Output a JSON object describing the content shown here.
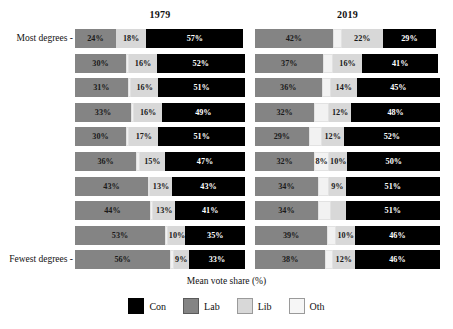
{
  "chart_data": {
    "type": "bar",
    "subtype": "stacked-horizontal-percent",
    "title": "",
    "xlabel": "Mean vote share (%)",
    "ylabel": "",
    "xlim": [
      0,
      100
    ],
    "grid": false,
    "legend_position": "bottom",
    "panels": [
      {
        "key": "p1979",
        "label": "1979"
      },
      {
        "key": "p2019",
        "label": "2019"
      }
    ],
    "y_tick_labels": {
      "top": "Most degrees -",
      "bottom": "Fewest degrees -"
    },
    "categories": [
      "Con",
      "Lab",
      "Lib",
      "Oth"
    ],
    "colors": {
      "Con": "#000000",
      "Lab": "#848484",
      "Lib": "#d8d8d8",
      "Oth": "#f2f2f2"
    },
    "series_order": [
      "Lab",
      "Oth",
      "Lib",
      "Con"
    ],
    "rows": [
      {
        "index": 0,
        "p1979": {
          "Lab": 24,
          "Oth": 0,
          "Lib": 18,
          "Con": 57,
          "labels": {
            "Lab": "24%",
            "Oth": "",
            "Lib": "18%",
            "Con": "57%"
          }
        },
        "p2019": {
          "Lab": 42,
          "Oth": 5,
          "Lib": 22,
          "Con": 29,
          "labels": {
            "Lab": "42%",
            "Oth": "",
            "Lib": "22%",
            "Con": "29%"
          }
        }
      },
      {
        "index": 1,
        "p1979": {
          "Lab": 30,
          "Oth": 2,
          "Lib": 16,
          "Con": 52,
          "labels": {
            "Lab": "30%",
            "Oth": "",
            "Lib": "16%",
            "Con": "52%"
          }
        },
        "p2019": {
          "Lab": 37,
          "Oth": 5,
          "Lib": 16,
          "Con": 41,
          "labels": {
            "Lab": "37%",
            "Oth": "",
            "Lib": "16%",
            "Con": "41%"
          }
        }
      },
      {
        "index": 2,
        "p1979": {
          "Lab": 31,
          "Oth": 2,
          "Lib": 16,
          "Con": 51,
          "labels": {
            "Lab": "31%",
            "Oth": "",
            "Lib": "16%",
            "Con": "51%"
          }
        },
        "p2019": {
          "Lab": 36,
          "Oth": 5,
          "Lib": 14,
          "Con": 45,
          "labels": {
            "Lab": "36%",
            "Oth": "",
            "Lib": "14%",
            "Con": "45%"
          }
        }
      },
      {
        "index": 3,
        "p1979": {
          "Lab": 33,
          "Oth": 2,
          "Lib": 16,
          "Con": 49,
          "labels": {
            "Lab": "33%",
            "Oth": "",
            "Lib": "16%",
            "Con": "49%"
          }
        },
        "p2019": {
          "Lab": 32,
          "Oth": 8,
          "Lib": 12,
          "Con": 48,
          "labels": {
            "Lab": "32%",
            "Oth": "",
            "Lib": "12%",
            "Con": "48%"
          }
        }
      },
      {
        "index": 4,
        "p1979": {
          "Lab": 30,
          "Oth": 2,
          "Lib": 17,
          "Con": 51,
          "labels": {
            "Lab": "30%",
            "Oth": "",
            "Lib": "17%",
            "Con": "51%"
          }
        },
        "p2019": {
          "Lab": 29,
          "Oth": 7,
          "Lib": 12,
          "Con": 52,
          "labels": {
            "Lab": "29%",
            "Oth": "",
            "Lib": "12%",
            "Con": "52%"
          }
        }
      },
      {
        "index": 5,
        "p1979": {
          "Lab": 36,
          "Oth": 2,
          "Lib": 15,
          "Con": 47,
          "labels": {
            "Lab": "36%",
            "Oth": "",
            "Lib": "15%",
            "Con": "47%"
          }
        },
        "p2019": {
          "Lab": 32,
          "Oth": 8,
          "Lib": 10,
          "Con": 50,
          "labels": {
            "Lab": "32%",
            "Oth": "8%",
            "Lib": "10%",
            "Con": "50%"
          }
        }
      },
      {
        "index": 6,
        "p1979": {
          "Lab": 43,
          "Oth": 1,
          "Lib": 13,
          "Con": 43,
          "labels": {
            "Lab": "43%",
            "Oth": "",
            "Lib": "13%",
            "Con": "43%"
          }
        },
        "p2019": {
          "Lab": 34,
          "Oth": 6,
          "Lib": 9,
          "Con": 51,
          "labels": {
            "Lab": "34%",
            "Oth": "",
            "Lib": "9%",
            "Con": "51%"
          }
        }
      },
      {
        "index": 7,
        "p1979": {
          "Lab": 44,
          "Oth": 2,
          "Lib": 13,
          "Con": 41,
          "labels": {
            "Lab": "44%",
            "Oth": "",
            "Lib": "13%",
            "Con": "41%"
          }
        },
        "p2019": {
          "Lab": 34,
          "Oth": 7,
          "Lib": 8,
          "Con": 51,
          "labels": {
            "Lab": "34%",
            "Oth": "",
            "Lib": "",
            "Con": "51%"
          }
        }
      },
      {
        "index": 8,
        "p1979": {
          "Lab": 53,
          "Oth": 2,
          "Lib": 10,
          "Con": 35,
          "labels": {
            "Lab": "53%",
            "Oth": "",
            "Lib": "10%",
            "Con": "35%"
          }
        },
        "p2019": {
          "Lab": 39,
          "Oth": 5,
          "Lib": 10,
          "Con": 46,
          "labels": {
            "Lab": "39%",
            "Oth": "",
            "Lib": "10%",
            "Con": "46%"
          }
        }
      },
      {
        "index": 9,
        "p1979": {
          "Lab": 56,
          "Oth": 2,
          "Lib": 9,
          "Con": 33,
          "labels": {
            "Lab": "56%",
            "Oth": "",
            "Lib": "9%",
            "Con": "33%"
          }
        },
        "p2019": {
          "Lab": 38,
          "Oth": 4,
          "Lib": 12,
          "Con": 46,
          "labels": {
            "Lab": "38%",
            "Oth": "",
            "Lib": "12%",
            "Con": "46%"
          }
        }
      }
    ],
    "legend": [
      {
        "key": "con",
        "label": "Con",
        "color": "#000000"
      },
      {
        "key": "lab",
        "label": "Lab",
        "color": "#848484"
      },
      {
        "key": "lib",
        "label": "Lib",
        "color": "#d8d8d8"
      },
      {
        "key": "oth",
        "label": "Oth",
        "color": "#f2f2f2"
      }
    ]
  }
}
